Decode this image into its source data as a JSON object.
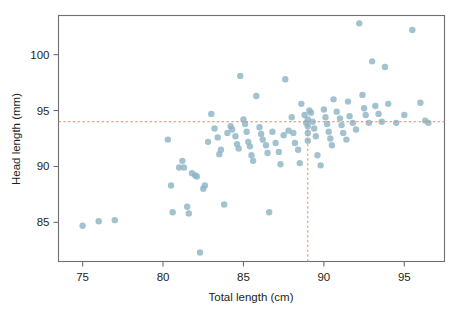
{
  "figure": {
    "background_color": "#ffffff",
    "point_color": "#8fb4c4",
    "refline_color": "#e08a6a",
    "axis_color": "#6f6f73"
  },
  "chart_data": {
    "type": "scatter",
    "title": "",
    "xlabel": "Total length (cm)",
    "ylabel": "Head length (mm)",
    "xlim": [
      73.5,
      97.5
    ],
    "ylim": [
      81.5,
      103.5
    ],
    "grid": false,
    "legend": null,
    "xticks": [
      75,
      80,
      85,
      90,
      95
    ],
    "yticks": [
      85,
      90,
      95,
      100
    ],
    "xtick_labels": [
      "75",
      "80",
      "85",
      "90",
      "95"
    ],
    "ytick_labels": [
      "85",
      "90",
      "95",
      "100"
    ],
    "annotations": [
      {
        "name": "horizontal-reference-line",
        "orientation": "horizontal",
        "value": 94.0,
        "style": "dashed",
        "color": "#e08a6a"
      },
      {
        "name": "vertical-reference-line",
        "orientation": "vertical",
        "value": 89.0,
        "style": "dashed",
        "color": "#e08a6a"
      }
    ],
    "n_points": 104,
    "x": [
      75.0,
      76.0,
      77.0,
      80.3,
      80.5,
      80.6,
      81.0,
      81.2,
      81.3,
      81.5,
      81.6,
      81.8,
      82.0,
      82.1,
      82.3,
      82.5,
      82.6,
      82.8,
      83.0,
      83.2,
      83.4,
      83.5,
      83.6,
      83.8,
      84.0,
      84.2,
      84.3,
      84.5,
      84.6,
      84.7,
      84.8,
      85.0,
      85.1,
      85.2,
      85.3,
      85.4,
      85.5,
      85.6,
      85.8,
      86.0,
      86.1,
      86.2,
      86.4,
      86.5,
      86.6,
      86.8,
      87.0,
      87.2,
      87.3,
      87.5,
      87.6,
      87.8,
      88.0,
      88.1,
      88.2,
      88.4,
      88.5,
      88.6,
      88.8,
      88.9,
      89.0,
      89.0,
      89.0,
      89.0,
      89.1,
      89.2,
      89.3,
      89.4,
      89.5,
      89.6,
      89.8,
      90.0,
      90.1,
      90.2,
      90.3,
      90.4,
      90.5,
      90.6,
      90.8,
      91.0,
      91.1,
      91.2,
      91.4,
      91.5,
      91.6,
      91.8,
      92.0,
      92.2,
      92.4,
      92.5,
      92.6,
      92.8,
      93.0,
      93.2,
      93.4,
      93.6,
      93.8,
      94.0,
      94.5,
      95.0,
      95.5,
      96.0,
      96.3,
      96.5
    ],
    "y": [
      84.7,
      85.1,
      85.2,
      92.4,
      88.3,
      85.9,
      89.9,
      90.5,
      89.9,
      86.4,
      85.8,
      89.4,
      89.2,
      89.1,
      82.3,
      88.0,
      88.3,
      92.2,
      94.7,
      93.4,
      92.6,
      91.1,
      91.5,
      86.6,
      93.0,
      93.6,
      93.3,
      92.7,
      92.0,
      91.6,
      98.1,
      94.2,
      93.8,
      93.1,
      92.2,
      91.8,
      91.0,
      90.5,
      96.3,
      93.5,
      92.9,
      92.4,
      91.9,
      91.2,
      85.9,
      93.1,
      92.1,
      91.3,
      90.2,
      92.8,
      97.8,
      93.2,
      94.4,
      93.0,
      92.1,
      91.5,
      90.3,
      95.6,
      94.6,
      93.9,
      94.2,
      93.6,
      93.0,
      92.3,
      95.0,
      94.8,
      94.0,
      93.4,
      92.7,
      91.0,
      90.1,
      95.1,
      94.4,
      93.8,
      93.1,
      92.5,
      91.9,
      96.0,
      94.9,
      94.3,
      93.7,
      93.0,
      92.4,
      95.8,
      94.5,
      93.9,
      93.3,
      102.8,
      96.4,
      95.2,
      94.6,
      93.9,
      99.4,
      95.4,
      94.7,
      94.0,
      98.9,
      95.6,
      93.9,
      94.6,
      102.2,
      95.7,
      94.1,
      93.9
    ]
  }
}
